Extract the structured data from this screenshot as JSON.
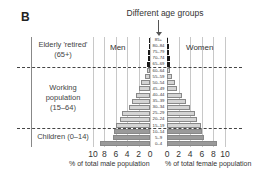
{
  "panel_letter": "B",
  "top_label": "Different age groups",
  "labels": {
    "men": "Men",
    "women": "Women"
  },
  "groups": {
    "elderly": {
      "line1": "Elderly 'retired'",
      "line2": "(65+)"
    },
    "working": {
      "line1": "Working",
      "line2": "population",
      "line3": "(15–64)"
    },
    "children": {
      "line1": "Children (0–14)"
    }
  },
  "axes": {
    "male_title": "% of total male population",
    "female_title": "% of total female population",
    "male_ticks": [
      "10",
      "8",
      "6",
      "4",
      "2",
      "0"
    ],
    "female_ticks": [
      "0",
      "2",
      "4",
      "6",
      "8",
      "10"
    ]
  },
  "colors": {
    "children": "#9a9a9a",
    "working": "#d4d4d4",
    "elderly": "#1a1a1a",
    "grid": "#c8c8c8"
  },
  "chart_data": {
    "type": "bar",
    "subtype": "population-pyramid",
    "title": "Different age groups",
    "xlabel_left": "% of total male population",
    "xlabel_right": "% of total female population",
    "xlim": [
      0,
      10
    ],
    "categories": [
      "85+",
      "80–84",
      "75–79",
      "70–74",
      "65–69",
      "60–64",
      "55–59",
      "50–54",
      "45–49",
      "40–44",
      "35–39",
      "30–34",
      "25–29",
      "20–24",
      "15–19",
      "10–14",
      "5–9",
      "0–4"
    ],
    "series": [
      {
        "name": "Men",
        "values": [
          0.2,
          0.2,
          0.3,
          0.4,
          0.5,
          0.6,
          0.9,
          1.5,
          1.9,
          2.5,
          3.2,
          3.7,
          4.9,
          5.2,
          6.0,
          6.3,
          6.5,
          8.8
        ]
      },
      {
        "name": "Women",
        "values": [
          0.2,
          0.3,
          0.4,
          0.5,
          0.6,
          0.6,
          0.9,
          1.4,
          1.8,
          2.5,
          3.2,
          4.0,
          4.9,
          5.2,
          5.8,
          6.1,
          6.4,
          8.7
        ]
      }
    ],
    "group_bands": [
      {
        "name": "Elderly 'retired' (65+)",
        "categories": [
          "85+",
          "80–84",
          "75–79",
          "70–74",
          "65–69"
        ]
      },
      {
        "name": "Working population (15–64)",
        "categories": [
          "60–64",
          "55–59",
          "50–54",
          "45–49",
          "40–44",
          "35–39",
          "30–34",
          "25–29",
          "20–24",
          "15–19"
        ]
      },
      {
        "name": "Children (0–14)",
        "categories": [
          "10–14",
          "5–9",
          "0–4"
        ]
      }
    ],
    "grid": true,
    "legend": "none"
  }
}
